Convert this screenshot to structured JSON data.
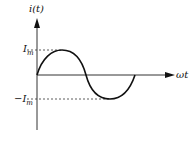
{
  "diagram": {
    "y_axis_label": "i(t)",
    "x_axis_label": "ωt",
    "peak_label": "I",
    "peak_sub": "m",
    "trough_label": "−I",
    "trough_sub": "m",
    "colors": {
      "line": "#111111",
      "axis": "#333333",
      "dash": "#333333"
    }
  }
}
